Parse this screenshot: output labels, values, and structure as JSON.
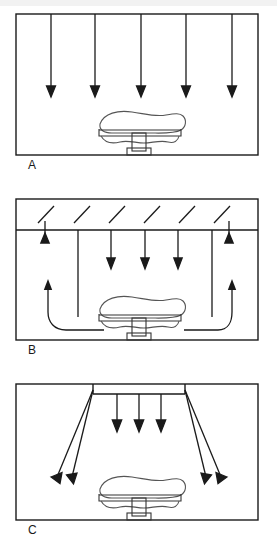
{
  "figure": {
    "background_color": "#ffffff",
    "line_color": "#1a1a1a",
    "width": 277,
    "height": 554
  },
  "panels": [
    {
      "id": "A",
      "label": "A",
      "name": "unidirectional-downward-flow",
      "box": {
        "x": 16,
        "y": 14,
        "w": 242,
        "h": 141
      },
      "label_pos": {
        "x": 28,
        "y": 162
      },
      "has_plenum_band": false,
      "plenum": null,
      "supply_arrows": {
        "type": "vertical-down-full",
        "count": 5,
        "x_positions": [
          51,
          95,
          141,
          186,
          232
        ],
        "y_start": 14,
        "y_end": 96,
        "arrowhead": "down"
      },
      "diagonal_arrows": [],
      "return_arrows": [],
      "short_up_arrows": [],
      "hatch_marks": 0,
      "table": {
        "cx": 140,
        "base_y": 152
      }
    },
    {
      "id": "B",
      "label": "B",
      "name": "plenum-supply-with-low-level-return",
      "box": {
        "x": 16,
        "y": 199,
        "w": 242,
        "h": 141
      },
      "label_pos": {
        "x": 28,
        "y": 347
      },
      "has_plenum_band": true,
      "plenum": {
        "x": 16,
        "y": 199,
        "w": 242,
        "h": 31
      },
      "hatch_marks": 6,
      "hatch_x_positions": [
        46,
        82,
        117,
        152,
        187,
        222
      ],
      "supply_arrows": {
        "type": "vertical-down-mixed",
        "count": 6,
        "x_positions": [
          45,
          78,
          111,
          145,
          178,
          212
        ],
        "y_start": 230,
        "long_line_x": [
          78,
          212
        ],
        "long_line_y_end": 317,
        "short_arrow_y_end": 268,
        "arrowhead": "down"
      },
      "short_up_arrows": {
        "count": 2,
        "x_positions": [
          45,
          229
        ],
        "y_bottom": 241,
        "y_top": 227,
        "arrowhead": "up"
      },
      "return_arrows": {
        "count": 2,
        "description": "curved low-level return air paths rising at side walls",
        "left": {
          "start_x": 104,
          "start_y": 330,
          "up_x": 48,
          "up_y": 281
        },
        "right": {
          "start_x": 184,
          "start_y": 330,
          "up_x": 228,
          "up_y": 281
        },
        "arrowhead": "up"
      },
      "diagonal_arrows": [],
      "table": {
        "cx": 140,
        "base_y": 337
      }
    },
    {
      "id": "C",
      "label": "C",
      "name": "central-diffuser-diverging-flow",
      "box": {
        "x": 16,
        "y": 384,
        "w": 242,
        "h": 136
      },
      "label_pos": {
        "x": 28,
        "y": 528
      },
      "has_plenum_band": false,
      "plenum": null,
      "diffuser": {
        "x1": 93,
        "x2": 185,
        "y": 394
      },
      "supply_arrows": {
        "type": "vertical-down-short",
        "count": 3,
        "x_positions": [
          117,
          138,
          160
        ],
        "y_start": 394,
        "y_end": 431,
        "arrowhead": "down"
      },
      "diagonal_arrows": {
        "count": 4,
        "description": "diverging jets from diffuser ends toward side walls",
        "left": [
          {
            "x1": 93,
            "y1": 391,
            "x2": 54,
            "y2": 483
          },
          {
            "x1": 93,
            "y1": 391,
            "x2": 70,
            "y2": 483
          }
        ],
        "right": [
          {
            "x1": 185,
            "y1": 391,
            "x2": 208,
            "y2": 483
          },
          {
            "x1": 185,
            "y1": 391,
            "x2": 224,
            "y2": 483
          }
        ],
        "arrowhead": "outward-down"
      },
      "short_up_arrows": [],
      "return_arrows": [],
      "hatch_marks": 0,
      "table": {
        "cx": 140,
        "base_y": 517
      }
    }
  ],
  "table_figure": {
    "name": "operating-table-with-patient",
    "description": "Operating table with draped patient silhouette on pedestal base",
    "parts": [
      "patient-outline",
      "table-top",
      "pedestal-column",
      "floor-base"
    ]
  }
}
